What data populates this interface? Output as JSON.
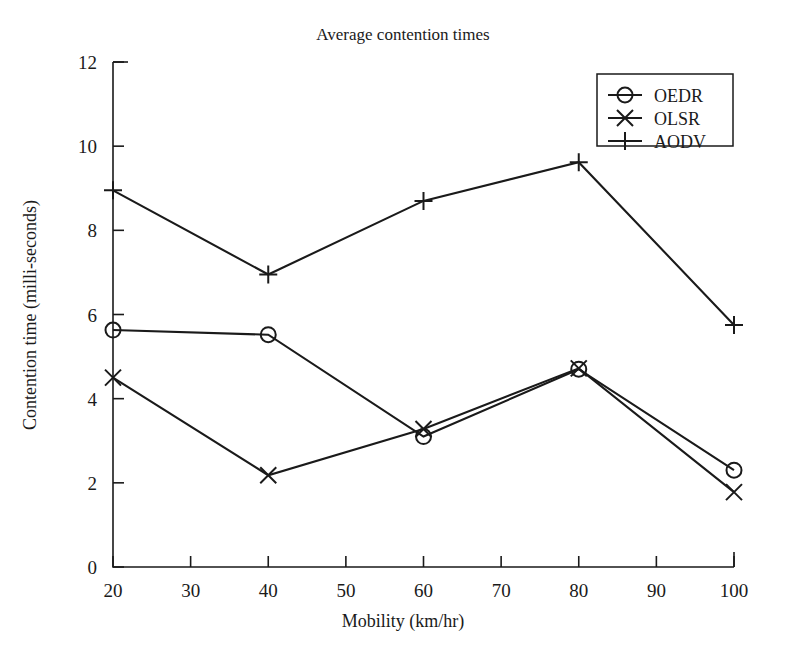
{
  "chart_data": {
    "type": "line",
    "title": "Average contention times",
    "xlabel": "Mobility (km/hr)",
    "ylabel": "Contention time (milli-seconds)",
    "x": [
      20,
      40,
      60,
      80,
      100
    ],
    "xlim": [
      20,
      100
    ],
    "ylim": [
      0,
      12
    ],
    "xticks": [
      20,
      30,
      40,
      50,
      60,
      70,
      80,
      90,
      100
    ],
    "yticks": [
      0,
      2,
      4,
      6,
      8,
      10,
      12
    ],
    "grid": false,
    "legend_position": "top-right",
    "series": [
      {
        "name": "OEDR",
        "marker": "circle",
        "values": [
          5.63,
          5.52,
          3.1,
          4.7,
          2.3
        ]
      },
      {
        "name": "OLSR",
        "marker": "cross-x",
        "values": [
          4.5,
          2.18,
          3.28,
          4.72,
          1.78
        ]
      },
      {
        "name": "AODV",
        "marker": "plus",
        "values": [
          8.95,
          6.95,
          8.7,
          9.62,
          5.75
        ]
      }
    ]
  },
  "colors": {
    "ink": "#1a1a1a",
    "background": "#ffffff"
  }
}
